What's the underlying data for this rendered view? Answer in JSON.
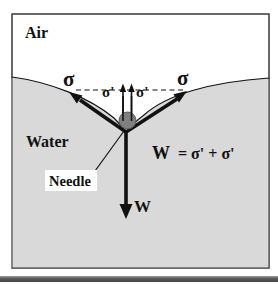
{
  "diagram": {
    "air_label": "Air",
    "water_label": "Water",
    "needle_label": "Needle",
    "sigma_left": "σ",
    "sigma_right": "σ",
    "sigma_prime_left": "σ'",
    "sigma_prime_right": "σ'",
    "weight_label": "W",
    "equation": {
      "lhs": "W",
      "rhs": "= σ' + σ'"
    },
    "colors": {
      "water": "#d9d9d9",
      "needle": "#7f7f7f",
      "ink": "#000000",
      "frame_border": "#4d4d4d",
      "bottom_bar_dark": "#4a4a4a",
      "bottom_bar_light": "#9a9a9a"
    }
  }
}
